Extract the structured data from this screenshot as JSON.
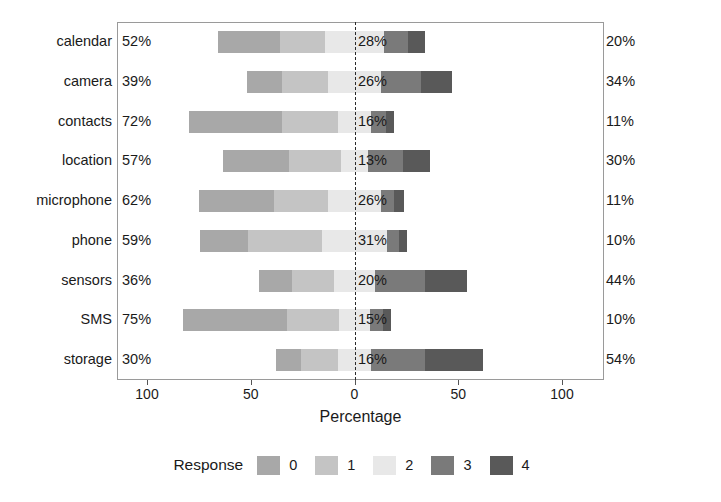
{
  "chart_data": {
    "type": "bar",
    "subtype": "diverging-stacked-likert",
    "title": "",
    "xlabel": "Percentage",
    "ylabel": "",
    "xlim": [
      -100,
      100
    ],
    "xticks": [
      100,
      50,
      0,
      50,
      100
    ],
    "xticklabels": [
      "100",
      "50",
      "0",
      "50",
      "100"
    ],
    "grid": false,
    "legend": {
      "title": "Response",
      "position": "bottom",
      "entries": [
        {
          "label": "0",
          "color": "#a8a8a8"
        },
        {
          "label": "1",
          "color": "#c4c4c4"
        },
        {
          "label": "2",
          "color": "#e8e8e8"
        },
        {
          "label": "3",
          "color": "#7a7a7a"
        },
        {
          "label": "4",
          "color": "#595959"
        }
      ]
    },
    "categories": [
      "calendar",
      "camera",
      "contacts",
      "location",
      "microphone",
      "phone",
      "sensors",
      "SMS",
      "storage"
    ],
    "series": [
      {
        "name": "0",
        "color": "#a8a8a8",
        "values": [
          30,
          17,
          45,
          32,
          36,
          23,
          16,
          50,
          12
        ]
      },
      {
        "name": "1",
        "color": "#c4c4c4",
        "values": [
          22,
          22,
          27,
          25,
          26,
          36,
          20,
          25,
          18
        ]
      },
      {
        "name": "2",
        "color": "#e8e8e8",
        "values": [
          28,
          26,
          16,
          13,
          26,
          31,
          20,
          15,
          16
        ]
      },
      {
        "name": "3",
        "color": "#7a7a7a",
        "values": [
          12,
          19,
          7,
          17,
          6,
          6,
          24,
          6,
          26
        ]
      },
      {
        "name": "4",
        "color": "#595959",
        "values": [
          8,
          15,
          4,
          13,
          5,
          4,
          20,
          4,
          28
        ]
      }
    ],
    "rows": [
      {
        "category": "calendar",
        "left_pct": "52%",
        "mid_pct": "28%",
        "right_pct": "20%",
        "left_value": 52,
        "mid_value": 28,
        "right_value": 20
      },
      {
        "category": "camera",
        "left_pct": "39%",
        "mid_pct": "26%",
        "right_pct": "34%",
        "left_value": 39,
        "mid_value": 26,
        "right_value": 34
      },
      {
        "category": "contacts",
        "left_pct": "72%",
        "mid_pct": "16%",
        "right_pct": "11%",
        "left_value": 72,
        "mid_value": 16,
        "right_value": 11
      },
      {
        "category": "location",
        "left_pct": "57%",
        "mid_pct": "13%",
        "right_pct": "30%",
        "left_value": 57,
        "mid_value": 13,
        "right_value": 30
      },
      {
        "category": "microphone",
        "left_pct": "62%",
        "mid_pct": "26%",
        "right_pct": "11%",
        "left_value": 62,
        "mid_value": 26,
        "right_value": 11
      },
      {
        "category": "phone",
        "left_pct": "59%",
        "mid_pct": "31%",
        "right_pct": "10%",
        "left_value": 59,
        "mid_value": 31,
        "right_value": 10
      },
      {
        "category": "sensors",
        "left_pct": "36%",
        "mid_pct": "20%",
        "right_pct": "44%",
        "left_value": 36,
        "mid_value": 20,
        "right_value": 44
      },
      {
        "category": "SMS",
        "left_pct": "75%",
        "mid_pct": "15%",
        "right_pct": "10%",
        "left_value": 75,
        "mid_value": 15,
        "right_value": 10
      },
      {
        "category": "storage",
        "left_pct": "30%",
        "mid_pct": "16%",
        "right_pct": "54%",
        "left_value": 30,
        "mid_value": 16,
        "right_value": 54
      }
    ]
  }
}
